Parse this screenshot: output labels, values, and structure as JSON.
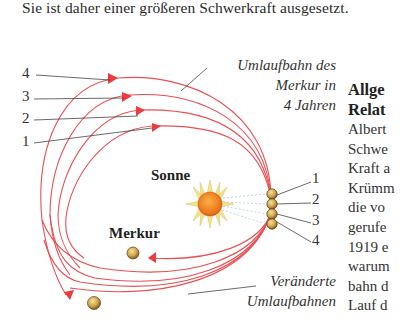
{
  "caption_top": "Sie ist daher einer größeren Schwerkraft ausgesetzt.",
  "diagram": {
    "left_numbers": [
      "4",
      "3",
      "2",
      "1"
    ],
    "right_numbers": [
      "1",
      "2",
      "3",
      "4"
    ],
    "label_orbit_4_years": [
      "Umlaufbahn des",
      "Merkur in",
      "4 Jahren"
    ],
    "label_sun": "Sonne",
    "label_mercury": "Merkur",
    "label_changed_orbits": [
      "Veränderte",
      "Umlaufbahnen"
    ],
    "colors": {
      "orbit": "#e8464a",
      "arrow": "#ee3b3f",
      "leader": "#333333",
      "sun": "#f08a22",
      "sun_rays": "#f4e38a",
      "planet": "#c9a24a"
    }
  },
  "side_text": {
    "heading": [
      "Allge",
      "Relat"
    ],
    "lines": [
      "Albert",
      "Schwe",
      "Kraft a",
      "Krümm",
      "die vo",
      "gerufe",
      "1919 e",
      "warum",
      "bahn d",
      "Lauf d"
    ]
  }
}
